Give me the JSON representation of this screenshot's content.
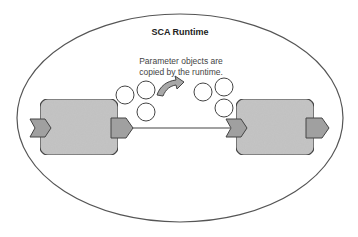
{
  "diagram": {
    "container": {
      "label": "SCA Runtime",
      "shape": "ellipse"
    },
    "caption": {
      "line1": "Parameter objects are",
      "line2": "copied by the runtime."
    },
    "components": [
      {
        "id": "source-component",
        "position": "left"
      },
      {
        "id": "target-component",
        "position": "right"
      }
    ],
    "wire": {
      "from": "source-component.reference",
      "to": "target-component.service"
    },
    "parameter_objects": {
      "source_count": 3,
      "copied_count": 3
    },
    "colors": {
      "component_fill": "#c4c4c4",
      "port_fill": "#a0a0a0",
      "stroke": "#444444",
      "arrow_fill": "#a8a8a8"
    }
  }
}
